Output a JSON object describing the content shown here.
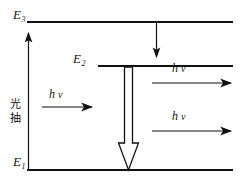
{
  "figure": {
    "type": "energy-level-diagram",
    "background_color": "#ffffff",
    "line_color": "#111111"
  },
  "levels": [
    {
      "id": "E3",
      "label_base": "E",
      "label_sub": "3",
      "line_y": 22,
      "line_x_start": 27,
      "line_x_end": 233
    },
    {
      "id": "E2",
      "label_base": "E",
      "label_sub": "2",
      "line_y": 66,
      "line_x_start": 98,
      "line_x_end": 233
    },
    {
      "id": "E1",
      "label_base": "E",
      "label_sub": "1",
      "line_y": 170,
      "line_x_start": 27,
      "line_x_end": 233
    }
  ],
  "pump": {
    "text_lines": [
      "光",
      "抽"
    ],
    "full_text": "光抽",
    "arrow_direction": "up",
    "from_level": "E1",
    "to_level": "E3"
  },
  "transitions": [
    {
      "id": "relaxation",
      "direction": "down",
      "from_level": "E3",
      "to_level": "E2",
      "style": "solid-thin"
    },
    {
      "id": "lasing",
      "direction": "down",
      "from_level": "E2",
      "to_level": "E1",
      "style": "hollow-outline"
    }
  ],
  "photon_arrows": [
    {
      "id": "incident-photon",
      "h": "h",
      "nu": "ν",
      "direction": "right",
      "x_start": 42,
      "x_end": 93,
      "y": 107
    },
    {
      "id": "emitted-photon-upper",
      "h": "h",
      "nu": "ν",
      "direction": "right",
      "x_start": 152,
      "x_end": 232,
      "y": 83
    },
    {
      "id": "emitted-photon-lower",
      "h": "h",
      "nu": "ν",
      "direction": "right",
      "x_start": 152,
      "x_end": 232,
      "y": 131
    }
  ]
}
